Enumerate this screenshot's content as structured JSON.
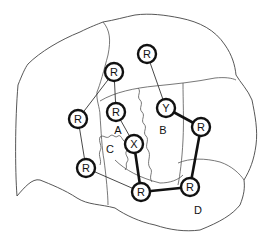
{
  "diagram": {
    "nodes": [
      {
        "id": "n1",
        "label": "R",
        "x": 147,
        "y": 54
      },
      {
        "id": "n2",
        "label": "R",
        "x": 114,
        "y": 72
      },
      {
        "id": "n3",
        "label": "R",
        "x": 78,
        "y": 119
      },
      {
        "id": "n4",
        "label": "R",
        "x": 116,
        "y": 112
      },
      {
        "id": "n5",
        "label": "Y",
        "x": 166,
        "y": 108
      },
      {
        "id": "n6",
        "label": "R",
        "x": 201,
        "y": 127
      },
      {
        "id": "n7",
        "label": "X",
        "x": 134,
        "y": 144
      },
      {
        "id": "n8",
        "label": "R",
        "x": 86,
        "y": 168
      },
      {
        "id": "n9",
        "label": "R",
        "x": 141,
        "y": 192
      },
      {
        "id": "n10",
        "label": "R",
        "x": 190,
        "y": 187
      }
    ],
    "edges": [
      {
        "from": "n1",
        "to": "n5",
        "style": "thin"
      },
      {
        "from": "n2",
        "to": "n4",
        "style": "thin"
      },
      {
        "from": "n2",
        "to": "n3",
        "style": "thin"
      },
      {
        "from": "n3",
        "to": "n8",
        "style": "thin"
      },
      {
        "from": "n4",
        "to": "n7",
        "style": "thin"
      },
      {
        "from": "n8",
        "to": "n9",
        "style": "thin"
      },
      {
        "from": "n5",
        "to": "n6",
        "style": "thick"
      },
      {
        "from": "n6",
        "to": "n10",
        "style": "thick"
      },
      {
        "from": "n10",
        "to": "n9",
        "style": "thick"
      },
      {
        "from": "n9",
        "to": "n7",
        "style": "thick"
      }
    ],
    "regions": [
      {
        "label": "A",
        "x": 118,
        "y": 130
      },
      {
        "label": "B",
        "x": 163,
        "y": 130
      },
      {
        "label": "C",
        "x": 110,
        "y": 149
      },
      {
        "label": "D",
        "x": 198,
        "y": 210
      }
    ]
  }
}
